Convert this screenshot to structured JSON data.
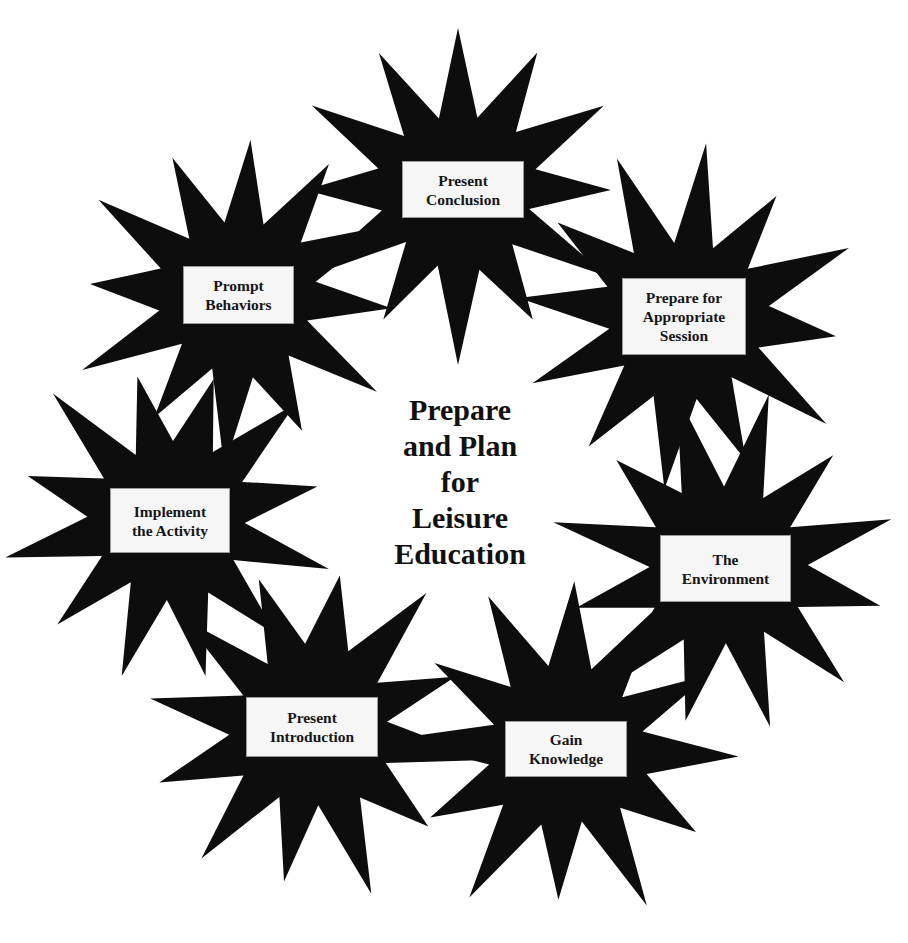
{
  "diagram": {
    "type": "cycle",
    "colors": {
      "star_fill": "#0d0d0d",
      "label_background": "#f6f6f6",
      "text": "#161616",
      "page_background": "#ffffff"
    },
    "center_title": {
      "lines": [
        "Prepare",
        "and Plan",
        "for",
        "Leisure",
        "Education"
      ]
    },
    "steps": [
      {
        "id": "present-conclusion",
        "label": "Present\nConclusion"
      },
      {
        "id": "prepare-for-appropriate-session",
        "label": "Prepare for\nAppropriate\nSession"
      },
      {
        "id": "the-environment",
        "label": "The\nEnvironment"
      },
      {
        "id": "gain-knowledge",
        "label": "Gain\nKnowledge"
      },
      {
        "id": "present-introduction",
        "label": "Present\nIntroduction"
      },
      {
        "id": "implement-the-activity",
        "label": "Implement\nthe Activity"
      },
      {
        "id": "prompt-behaviors",
        "label": "Prompt\nBehaviors"
      }
    ]
  }
}
